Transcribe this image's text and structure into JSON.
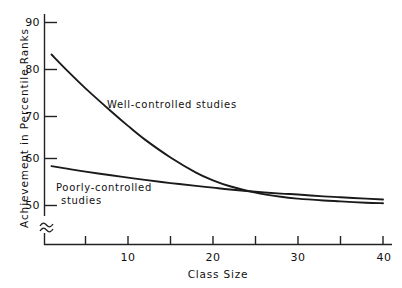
{
  "chart_data": {
    "type": "line",
    "title": "",
    "xlabel": "Class Size",
    "ylabel": "Achievement in Percentile Ranks",
    "xlim": [
      0,
      41
    ],
    "ylim": [
      48,
      91
    ],
    "grid": false,
    "legend_position": "inline-annotations",
    "axis_break": "y-axis break below 50",
    "x_ticks": [
      5,
      10,
      15,
      20,
      25,
      30,
      35,
      40
    ],
    "x_tick_labels": [
      "",
      "10",
      "",
      "20",
      "",
      "30",
      "",
      "40"
    ],
    "y_ticks": [
      50,
      60,
      70,
      80,
      90
    ],
    "y_tick_labels": [
      "50",
      "60",
      "70",
      "80",
      "90"
    ],
    "x": [
      1,
      3,
      5,
      8,
      10,
      12,
      15,
      18,
      20,
      22,
      25,
      28,
      30,
      33,
      35,
      38,
      40
    ],
    "series": [
      {
        "name": "Well-controlled studies",
        "values": [
          83.0,
          79.2,
          75.6,
          70.6,
          67.4,
          64.4,
          60.5,
          57.2,
          55.5,
          54.2,
          52.8,
          51.9,
          51.5,
          51.1,
          50.9,
          50.6,
          50.5
        ]
      },
      {
        "name": "Poorly-controlled studies",
        "values": [
          58.6,
          58.0,
          57.4,
          56.6,
          56.1,
          55.6,
          54.9,
          54.3,
          53.9,
          53.5,
          53.0,
          52.6,
          52.4,
          52.0,
          51.8,
          51.5,
          51.3
        ]
      }
    ],
    "annotations": [
      {
        "text": "Well-controlled studies",
        "x_px": 107,
        "y_px": 105
      },
      {
        "text": "Poorly-controlled",
        "x_px": 56,
        "y_px": 187
      },
      {
        "text": "studies",
        "x_px": 61,
        "y_px": 200
      }
    ],
    "colors": {
      "line": "#1a1a1a",
      "axis": "#333333",
      "background": "#ffffff"
    }
  },
  "axes": {
    "y_title": "Achievement in Percentile Ranks",
    "x_title": "Class Size",
    "y_tick_90": "90",
    "y_tick_80": "80",
    "y_tick_70": "70",
    "y_tick_60": "60",
    "y_tick_50": "50",
    "x_tick_10": "10",
    "x_tick_20": "20",
    "x_tick_30": "30",
    "x_tick_40": "40"
  },
  "labels": {
    "well_controlled": "Well-controlled studies",
    "poorly_controlled_line1": "Poorly-controlled",
    "poorly_controlled_line2": "studies"
  }
}
